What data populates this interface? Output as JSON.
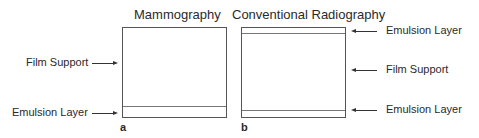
{
  "panel_a": {
    "title": "Mammography",
    "letter": "a",
    "labels": {
      "film_support": "Film Support",
      "emulsion_layer": "Emulsion Layer"
    }
  },
  "panel_b": {
    "title": "Conventional Radiography",
    "letter": "b",
    "labels": {
      "emulsion_top": "Emulsion Layer",
      "film_support": "Film Support",
      "emulsion_bottom": "Emulsion Layer"
    }
  }
}
